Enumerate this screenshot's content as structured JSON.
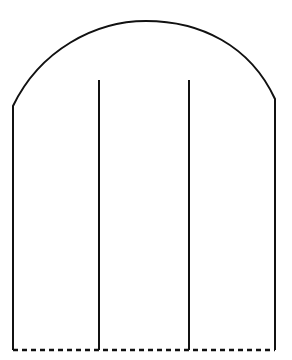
{
  "diagram": {
    "stroke_color": "#111111",
    "background": "#ffffff",
    "outline": {
      "left_wall": {
        "x": 13,
        "y_top": 106,
        "y_bottom": 350
      },
      "right_wall": {
        "x": 275,
        "y_top": 99,
        "y_bottom": 350
      },
      "arch_apex": {
        "x": 146,
        "y": 21
      }
    },
    "dividers": [
      {
        "x": 99,
        "y_top": 80,
        "y_bottom": 350
      },
      {
        "x": 189,
        "y_top": 80,
        "y_bottom": 350
      }
    ],
    "base": {
      "y": 350,
      "style": "dashed"
    }
  }
}
